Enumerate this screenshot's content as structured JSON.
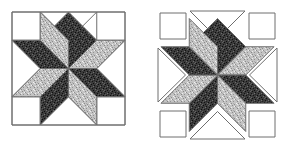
{
  "figure": {
    "title": "",
    "background_color": "#ffffff",
    "outline_color": "#6e6e6e",
    "width": 288,
    "height": 150
  },
  "palette": {
    "background_fabric": "#ffffff",
    "dark_fabric": "#3a3a3a",
    "dark_fabric_speckle": "#151515",
    "dark_fabric_highlight": "#6b6b6b",
    "light_fabric": "#c2c2c2",
    "light_fabric_speckle": "#8e8e8e",
    "light_fabric_highlight": "#efefef",
    "seam_line": "#6e6e6e"
  },
  "blocks": [
    {
      "id": "block-assembled",
      "label": "Assembled eight-pointed star block",
      "layout": "assembled",
      "origin": {
        "x": 12,
        "y": 12
      },
      "size": {
        "width": 113,
        "height": 113
      },
      "grid_units": 4,
      "corner_squares": 4,
      "edge_triangles": 4,
      "star_points": 8,
      "star_point_fabrics": [
        "dark_fabric",
        "light_fabric",
        "dark_fabric",
        "light_fabric",
        "dark_fabric",
        "light_fabric",
        "dark_fabric",
        "light_fabric"
      ],
      "star_point_directions": [
        "north",
        "northeast",
        "east",
        "southeast",
        "south",
        "southwest",
        "west",
        "northwest"
      ]
    },
    {
      "id": "block-exploded",
      "label": "Exploded eight-pointed star block",
      "layout": "exploded",
      "origin": {
        "x": 157,
        "y": 10
      },
      "size": {
        "width": 121,
        "height": 131
      },
      "grid_units": 4,
      "gap": 3,
      "corner_squares": 4,
      "edge_triangles": 4,
      "star_points": 8,
      "star_point_fabrics": [
        "dark_fabric",
        "light_fabric",
        "dark_fabric",
        "light_fabric",
        "dark_fabric",
        "light_fabric",
        "dark_fabric",
        "light_fabric"
      ],
      "star_point_directions": [
        "north",
        "northeast",
        "east",
        "southeast",
        "south",
        "southwest",
        "west",
        "northwest"
      ]
    }
  ]
}
